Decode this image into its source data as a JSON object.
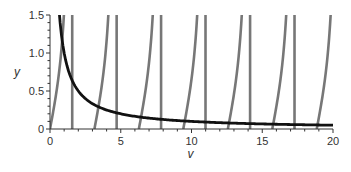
{
  "chart_data": {
    "type": "line",
    "title": "",
    "xlabel": "v",
    "ylabel": "y",
    "xlim": [
      0,
      20
    ],
    "ylim": [
      0,
      1.5
    ],
    "x_ticks": [
      "0",
      "5",
      "10",
      "15",
      "20"
    ],
    "y_ticks": [
      "0",
      "0.5",
      "1.0",
      "1.5"
    ],
    "grid": false,
    "legend": null,
    "series": [
      {
        "name": "tan branches",
        "color": "#777777",
        "description": "y = tan(v) branches starting at v = n*pi, rising toward asymptotes",
        "branch_starts": [
          0,
          3.14,
          6.28,
          9.42,
          12.57,
          15.71,
          18.85
        ]
      },
      {
        "name": "asymptotes",
        "color": "#777777",
        "description": "vertical lines at v = pi/2 + n*pi",
        "x": [
          1.57,
          4.71,
          7.85,
          10.99,
          14.14,
          17.28
        ]
      },
      {
        "name": "hyperbola",
        "color": "#111111",
        "description": "y = 1/v (decreasing curve)",
        "points": [
          [
            0.67,
            1.5
          ],
          [
            1,
            1.0
          ],
          [
            2,
            0.5
          ],
          [
            5,
            0.2
          ],
          [
            10,
            0.1
          ],
          [
            20,
            0.05
          ]
        ]
      }
    ]
  }
}
